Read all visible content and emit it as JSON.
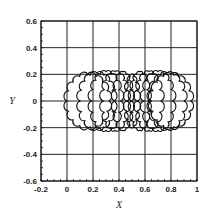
{
  "chart_data": {
    "type": "line",
    "title": "",
    "xlabel": "X",
    "ylabel": "Y",
    "xlim": [
      -0.2,
      1.0
    ],
    "ylim": [
      -0.6,
      0.6
    ],
    "grid": true,
    "xticks": [
      "-0.2",
      "0",
      "0.2",
      "0.4",
      "0.6",
      "0.8",
      "1"
    ],
    "yticks": [
      "0.6",
      "0.4",
      "0.2",
      "0",
      "-0.2",
      "-0.4",
      "-0.6"
    ],
    "series": [
      {
        "name": "curve-1",
        "cx": 0.16,
        "half_width": 0.16,
        "half_height": 0.2,
        "side": "left"
      },
      {
        "name": "curve-2",
        "cx": 0.23,
        "half_width": 0.13,
        "half_height": 0.21,
        "side": "left"
      },
      {
        "name": "curve-3",
        "cx": 0.3,
        "half_width": 0.11,
        "half_height": 0.22,
        "side": "left"
      },
      {
        "name": "curve-4",
        "cx": 0.37,
        "half_width": 0.09,
        "half_height": 0.22,
        "side": "left"
      },
      {
        "name": "curve-5",
        "cx": 0.43,
        "half_width": 0.06,
        "half_height": 0.22,
        "side": "left"
      },
      {
        "name": "curve-6",
        "cx": 0.5,
        "half_width": 0.04,
        "half_height": 0.2,
        "side": "center"
      },
      {
        "name": "curve-7",
        "cx": 0.56,
        "half_width": 0.06,
        "half_height": 0.22,
        "side": "right"
      },
      {
        "name": "curve-8",
        "cx": 0.63,
        "half_width": 0.09,
        "half_height": 0.22,
        "side": "right"
      },
      {
        "name": "curve-9",
        "cx": 0.7,
        "half_width": 0.11,
        "half_height": 0.22,
        "side": "right"
      },
      {
        "name": "curve-10",
        "cx": 0.77,
        "half_width": 0.13,
        "half_height": 0.21,
        "side": "right"
      },
      {
        "name": "curve-11",
        "cx": 0.8,
        "half_width": 0.15,
        "half_height": 0.2,
        "side": "right"
      }
    ]
  }
}
